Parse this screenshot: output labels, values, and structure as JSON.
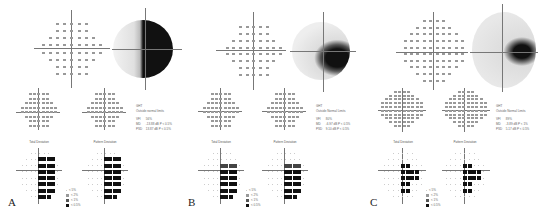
{
  "figure": {
    "panels": [
      {
        "letter": "A",
        "labels": {
          "total_deviation": "Total Deviation",
          "pattern_deviation": "Pattern Deviation"
        },
        "stats": {
          "ght_label": "GHT",
          "ght_value": "Outside normal limits",
          "vfi_label": "VFI",
          "vfi_value": "56%",
          "md_label": "MD",
          "md_value": "-13.88 dB  P < 0.5%",
          "psd_label": "PSD",
          "psd_value": "13.87 dB  P < 0.5%"
        },
        "grayscale_defect": "right-hemifield"
      },
      {
        "letter": "B",
        "labels": {
          "total_deviation": "Total Deviation",
          "pattern_deviation": "Pattern Deviation"
        },
        "stats": {
          "ght_label": "GHT",
          "ght_value": "Outside Normal Limits",
          "vfi_label": "VFI",
          "vfi_value": "80%",
          "md_label": "MD",
          "md_value": "-6.97 dB  P < 0.5%",
          "psd_label": "PSD",
          "psd_value": "9.10 dB  P < 0.5%"
        },
        "grayscale_defect": "right-lower-quadrant"
      },
      {
        "letter": "C",
        "labels": {
          "total_deviation": "Total Deviation",
          "pattern_deviation": "Pattern Deviation"
        },
        "stats": {
          "ght_label": "GHT",
          "ght_value": "Outside Normal Limits",
          "vfi_label": "VFI",
          "vfi_value": "89%",
          "md_label": "MD",
          "md_value": "-3.89 dB  P < 1%",
          "psd_label": "PSD",
          "psd_value": "5.17 dB  P < 0.5%"
        },
        "grayscale_defect": "right-paracentral"
      }
    ],
    "legend": [
      "< 5%",
      "< 2%",
      "< 1%",
      "< 0.5%"
    ],
    "colors": {
      "defect": "#111111",
      "partial": "#555555",
      "normal": "#e6e6e6",
      "axis": "#777777"
    }
  }
}
